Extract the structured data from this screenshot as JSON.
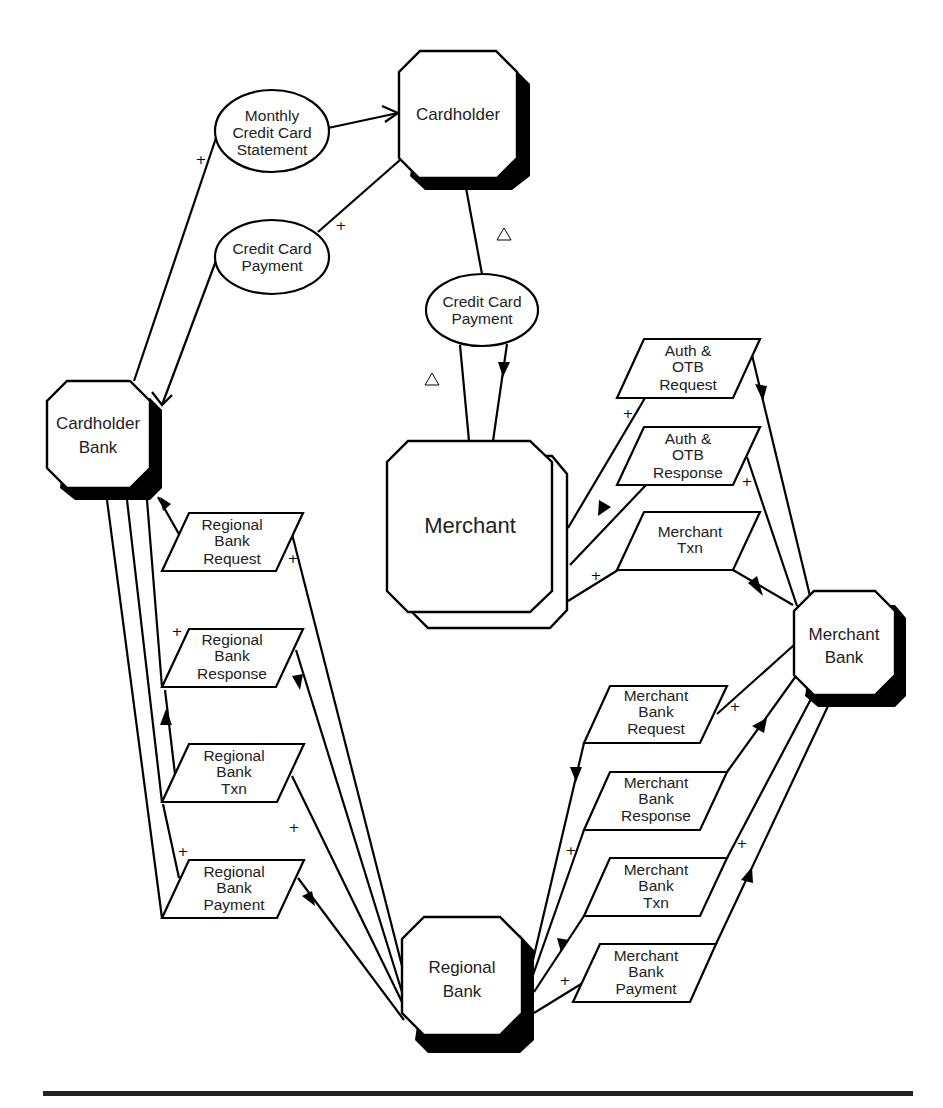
{
  "diagram": {
    "title": "",
    "nodes": {
      "cardholder": {
        "label": [
          "Cardholder"
        ]
      },
      "cardholder_bank": {
        "label": [
          "Cardholder",
          "Bank"
        ]
      },
      "merchant": {
        "label": [
          "Merchant"
        ]
      },
      "merchant_bank": {
        "label": [
          "Merchant",
          "Bank"
        ]
      },
      "regional_bank": {
        "label": [
          "Regional",
          "Bank"
        ]
      }
    },
    "ellipses": {
      "monthly_statement": {
        "label": [
          "Monthly",
          "Credit Card",
          "Statement"
        ]
      },
      "cc_payment_left": {
        "label": [
          "Credit Card",
          "Payment"
        ]
      },
      "cc_payment_mid": {
        "label": [
          "Credit Card",
          "Payment"
        ]
      }
    },
    "flows": {
      "auth_otb_request": {
        "label": [
          "Auth &",
          "OTB",
          "Request"
        ]
      },
      "auth_otb_response": {
        "label": [
          "Auth &",
          "OTB",
          "Response"
        ]
      },
      "merchant_txn": {
        "label": [
          "Merchant",
          "Txn"
        ]
      },
      "rb_request": {
        "label": [
          "Regional",
          "Bank",
          "Request"
        ]
      },
      "rb_response": {
        "label": [
          "Regional",
          "Bank",
          "Response"
        ]
      },
      "rb_txn": {
        "label": [
          "Regional",
          "Bank",
          "Txn"
        ]
      },
      "rb_payment": {
        "label": [
          "Regional",
          "Bank",
          "Payment"
        ]
      },
      "mb_request": {
        "label": [
          "Merchant",
          "Bank",
          "Request"
        ]
      },
      "mb_response": {
        "label": [
          "Merchant",
          "Bank",
          "Response"
        ]
      },
      "mb_txn": {
        "label": [
          "Merchant",
          "Bank",
          "Txn"
        ]
      },
      "mb_payment": {
        "label": [
          "Merchant",
          "Bank",
          "Payment"
        ]
      }
    },
    "markers": {
      "cross": "+",
      "delta": "△"
    }
  }
}
